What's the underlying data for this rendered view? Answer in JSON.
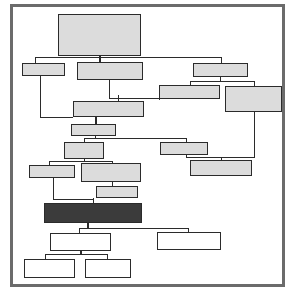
{
  "diagram": {
    "title": "",
    "type": "flowchart",
    "canvas": {
      "width": 302,
      "height": 298,
      "background": "#ffffff"
    },
    "frame": {
      "name": "diagram-border",
      "x": 10,
      "y": 4,
      "width": 275,
      "height": 283,
      "border_color": "#6b6b6b",
      "border_width": 3
    },
    "styles": {
      "fill_shaded": "#dcdcdc",
      "fill_light": "#e6e6e6",
      "fill_white": "#ffffff",
      "fill_dark": "#3b3b3b",
      "stroke": "#2b2b2b",
      "stroke_width": 1.5,
      "edge_color": "#2b2b2b",
      "edge_width": 1
    },
    "nodes": [
      {
        "id": "n1",
        "label": "",
        "x": 58,
        "y": 14,
        "width": 83,
        "height": 42,
        "fill": "shaded",
        "name": "process-box-root"
      },
      {
        "id": "n2",
        "label": "",
        "x": 22,
        "y": 63,
        "width": 43,
        "height": 13,
        "fill": "shaded",
        "name": "process-box-left-1"
      },
      {
        "id": "n3",
        "label": "",
        "x": 77,
        "y": 62,
        "width": 66,
        "height": 18,
        "fill": "shaded",
        "name": "process-box-center-1"
      },
      {
        "id": "n4",
        "label": "",
        "x": 193,
        "y": 63,
        "width": 55,
        "height": 14,
        "fill": "shaded",
        "name": "process-box-right-1"
      },
      {
        "id": "n5",
        "label": "",
        "x": 159,
        "y": 85,
        "width": 61,
        "height": 14,
        "fill": "shaded",
        "name": "process-box-right-2"
      },
      {
        "id": "n6",
        "label": "",
        "x": 225,
        "y": 86,
        "width": 57,
        "height": 26,
        "fill": "shaded",
        "name": "process-box-right-3"
      },
      {
        "id": "n7",
        "label": "",
        "x": 73,
        "y": 101,
        "width": 71,
        "height": 16,
        "fill": "shaded",
        "name": "process-box-center-2"
      },
      {
        "id": "n8",
        "label": "",
        "x": 71,
        "y": 124,
        "width": 45,
        "height": 12,
        "fill": "shaded",
        "name": "process-box-center-3"
      },
      {
        "id": "n9",
        "label": "",
        "x": 64,
        "y": 142,
        "width": 40,
        "height": 17,
        "fill": "shaded",
        "name": "process-box-center-4"
      },
      {
        "id": "n10",
        "label": "",
        "x": 160,
        "y": 142,
        "width": 48,
        "height": 13,
        "fill": "shaded",
        "name": "process-box-right-4"
      },
      {
        "id": "n11",
        "label": "",
        "x": 190,
        "y": 160,
        "width": 62,
        "height": 16,
        "fill": "shaded",
        "name": "process-box-right-5"
      },
      {
        "id": "n12",
        "label": "",
        "x": 29,
        "y": 165,
        "width": 46,
        "height": 13,
        "fill": "shaded",
        "name": "process-box-left-2"
      },
      {
        "id": "n13",
        "label": "",
        "x": 81,
        "y": 163,
        "width": 60,
        "height": 19,
        "fill": "shaded",
        "name": "process-box-center-5"
      },
      {
        "id": "n14",
        "label": "",
        "x": 96,
        "y": 186,
        "width": 42,
        "height": 12,
        "fill": "shaded",
        "name": "process-box-center-6"
      },
      {
        "id": "n15",
        "label": "",
        "x": 44,
        "y": 203,
        "width": 98,
        "height": 20,
        "fill": "dark",
        "name": "process-box-highlight"
      },
      {
        "id": "n16",
        "label": "",
        "x": 50,
        "y": 233,
        "width": 61,
        "height": 18,
        "fill": "white",
        "name": "process-box-output-1"
      },
      {
        "id": "n17",
        "label": "",
        "x": 157,
        "y": 232,
        "width": 64,
        "height": 18,
        "fill": "white",
        "name": "process-box-output-2"
      },
      {
        "id": "n18",
        "label": "",
        "x": 24,
        "y": 259,
        "width": 51,
        "height": 19,
        "fill": "white",
        "name": "process-box-output-3"
      },
      {
        "id": "n19",
        "label": "",
        "x": 85,
        "y": 259,
        "width": 46,
        "height": 19,
        "fill": "white",
        "name": "process-box-output-4"
      }
    ],
    "edges": [
      {
        "from": "n1",
        "to": "n3",
        "name": "edge-root-to-center-1"
      },
      {
        "from": "n1",
        "to": "n2",
        "name": "edge-root-to-left-1"
      },
      {
        "from": "n1",
        "to": "n4",
        "name": "edge-root-to-right-1"
      },
      {
        "from": "n4",
        "to": "n5",
        "name": "edge-right-1-to-right-2"
      },
      {
        "from": "n4",
        "to": "n6",
        "name": "edge-right-1-to-right-3"
      },
      {
        "from": "n3",
        "to": "n7",
        "name": "edge-center-1-to-center-2"
      },
      {
        "from": "n5",
        "to": "n7",
        "name": "edge-right-2-to-center-2"
      },
      {
        "from": "n2",
        "to": "n7",
        "name": "edge-left-1-to-center-2"
      },
      {
        "from": "n7",
        "to": "n8",
        "name": "edge-center-2-to-center-3"
      },
      {
        "from": "n8",
        "to": "n9",
        "name": "edge-center-3-to-center-4"
      },
      {
        "from": "n8",
        "to": "n10",
        "name": "edge-center-3-to-right-4"
      },
      {
        "from": "n10",
        "to": "n11",
        "name": "edge-right-4-to-right-5"
      },
      {
        "from": "n6",
        "to": "n11",
        "name": "edge-right-3-to-right-5"
      },
      {
        "from": "n9",
        "to": "n12",
        "name": "edge-center-4-to-left-2"
      },
      {
        "from": "n9",
        "to": "n13",
        "name": "edge-center-4-to-center-5"
      },
      {
        "from": "n13",
        "to": "n14",
        "name": "edge-center-5-to-center-6"
      },
      {
        "from": "n14",
        "to": "n15",
        "name": "edge-center-6-to-highlight"
      },
      {
        "from": "n12",
        "to": "n15",
        "name": "edge-left-2-to-highlight"
      },
      {
        "from": "n15",
        "to": "n16",
        "name": "edge-highlight-to-output-1"
      },
      {
        "from": "n15",
        "to": "n17",
        "name": "edge-highlight-to-output-2"
      },
      {
        "from": "n16",
        "to": "n18",
        "name": "edge-output-1-to-output-3"
      },
      {
        "from": "n16",
        "to": "n19",
        "name": "edge-output-1-to-output-4"
      }
    ],
    "segments": [
      {
        "name": "seg-root-stem-down",
        "x": 99,
        "y": 56,
        "w": 2,
        "h": 7
      },
      {
        "name": "seg-root-bus-horizontal",
        "x": 35,
        "y": 57,
        "w": 187,
        "h": 1
      },
      {
        "name": "seg-left1-drop",
        "x": 35,
        "y": 57,
        "w": 1,
        "h": 7
      },
      {
        "name": "seg-right1-drop",
        "x": 221,
        "y": 57,
        "w": 1,
        "h": 7
      },
      {
        "name": "seg-center1-drop",
        "x": 99,
        "y": 57,
        "w": 2,
        "h": 6
      },
      {
        "name": "seg-right1-stem-down",
        "x": 220,
        "y": 77,
        "w": 1,
        "h": 5
      },
      {
        "name": "seg-right1-bus",
        "x": 190,
        "y": 81,
        "w": 65,
        "h": 1
      },
      {
        "name": "seg-right2-drop",
        "x": 190,
        "y": 81,
        "w": 1,
        "h": 5
      },
      {
        "name": "seg-right3-drop",
        "x": 254,
        "y": 81,
        "w": 1,
        "h": 6
      },
      {
        "name": "seg-center1-stem-down",
        "x": 109,
        "y": 80,
        "w": 1,
        "h": 18
      },
      {
        "name": "seg-center2-feed-bus",
        "x": 109,
        "y": 98,
        "w": 10,
        "h": 1
      },
      {
        "name": "seg-right2-out-left",
        "x": 159,
        "y": 98,
        "w": 1,
        "h": 1
      },
      {
        "name": "seg-right2-down",
        "x": 159,
        "y": 99,
        "w": 1,
        "h": 1
      },
      {
        "name": "seg-right2-to-center2",
        "x": 118,
        "y": 98,
        "w": 42,
        "h": 1
      },
      {
        "name": "seg-center2-stem-in",
        "x": 118,
        "y": 95,
        "w": 1,
        "h": 6
      },
      {
        "name": "seg-left1-down-long",
        "x": 40,
        "y": 76,
        "w": 1,
        "h": 42
      },
      {
        "name": "seg-left1-to-center2",
        "x": 40,
        "y": 117,
        "w": 33,
        "h": 1
      },
      {
        "name": "seg-center2-stem-down",
        "x": 95,
        "y": 117,
        "w": 2,
        "h": 7
      },
      {
        "name": "seg-center3-stem-down",
        "x": 95,
        "y": 136,
        "w": 1,
        "h": 3
      },
      {
        "name": "seg-center3-bus",
        "x": 84,
        "y": 138,
        "w": 103,
        "h": 1
      },
      {
        "name": "seg-center4-drop",
        "x": 84,
        "y": 138,
        "w": 1,
        "h": 5
      },
      {
        "name": "seg-right4-drop",
        "x": 186,
        "y": 138,
        "w": 1,
        "h": 5
      },
      {
        "name": "seg-right4-stem-down",
        "x": 186,
        "y": 155,
        "w": 1,
        "h": 3
      },
      {
        "name": "seg-right4-bus",
        "x": 186,
        "y": 157,
        "w": 35,
        "h": 1
      },
      {
        "name": "seg-right5-drop",
        "x": 221,
        "y": 157,
        "w": 1,
        "h": 4
      },
      {
        "name": "seg-right3-down-long",
        "x": 254,
        "y": 112,
        "w": 1,
        "h": 45
      },
      {
        "name": "seg-right3-to-right5",
        "x": 221,
        "y": 157,
        "w": 34,
        "h": 1
      },
      {
        "name": "seg-center4-stem-down",
        "x": 84,
        "y": 159,
        "w": 1,
        "h": 2
      },
      {
        "name": "seg-center4-bus",
        "x": 49,
        "y": 161,
        "w": 64,
        "h": 1
      },
      {
        "name": "seg-left2-drop",
        "x": 49,
        "y": 161,
        "w": 1,
        "h": 5
      },
      {
        "name": "seg-center5-drop",
        "x": 112,
        "y": 161,
        "w": 1,
        "h": 3
      },
      {
        "name": "seg-center5-stem-down",
        "x": 112,
        "y": 182,
        "w": 1,
        "h": 5
      },
      {
        "name": "seg-center6-stem-down",
        "x": 93,
        "y": 198,
        "w": 1,
        "h": 6
      },
      {
        "name": "seg-left2-down-long",
        "x": 53,
        "y": 178,
        "w": 1,
        "h": 22
      },
      {
        "name": "seg-left2-to-highlight",
        "x": 53,
        "y": 199,
        "w": 41,
        "h": 1
      },
      {
        "name": "seg-highlight-stem-down",
        "x": 87,
        "y": 223,
        "w": 2,
        "h": 6
      },
      {
        "name": "seg-highlight-bus",
        "x": 79,
        "y": 228,
        "w": 110,
        "h": 1
      },
      {
        "name": "seg-output1-drop",
        "x": 79,
        "y": 228,
        "w": 1,
        "h": 6
      },
      {
        "name": "seg-output2-drop",
        "x": 188,
        "y": 228,
        "w": 1,
        "h": 5
      },
      {
        "name": "seg-output1-stem-down",
        "x": 80,
        "y": 251,
        "w": 2,
        "h": 4
      },
      {
        "name": "seg-output1-bus",
        "x": 45,
        "y": 254,
        "w": 63,
        "h": 1
      },
      {
        "name": "seg-output3-drop",
        "x": 45,
        "y": 254,
        "w": 1,
        "h": 6
      },
      {
        "name": "seg-output4-drop",
        "x": 107,
        "y": 254,
        "w": 1,
        "h": 6
      }
    ]
  }
}
